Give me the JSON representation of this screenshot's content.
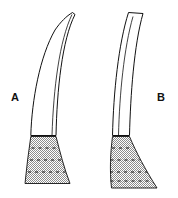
{
  "figure": {
    "background_color": "#ffffff",
    "outline_color": "#111111",
    "stipple_color": "#9a9a9a",
    "width": 178,
    "height": 198,
    "labels": [
      {
        "id": "A",
        "text": "A",
        "x": 11,
        "y": 92
      },
      {
        "id": "B",
        "text": "B",
        "x": 157,
        "y": 92
      }
    ],
    "specimens": [
      {
        "id": "A",
        "label": "A",
        "tip_style": "pointed",
        "shaft_path": "M 72.5 12.5 L 75.0 14.5 C 62.0 40.0 57.0 90.0 56.0 135.5 L 30.8 135.5 C 31.8 100.0 40.0 56.0 55.0 30.0 C 60.5 22.0 66.5 16.0 72.5 12.5 Z",
        "shaft_inner_path": "M 72.0 14.5 C 59.5 40.5 53.5 88.0 52.0 135.5",
        "base_path": "M 30.8 136.5 L 56.0 136.5 C 60.0 152.0 64.0 168.0 70.0 183.5 L 25.0 183.5 C 26.5 168.0 28.5 152.0 30.8 136.5 Z",
        "base_dashes": [
          "M 31.5 148.0 L 57.8 148.0",
          "M 30.0 160.0 L 61.0 160.0",
          "M 28.0 172.0 L 65.5 172.0"
        ],
        "base_top_y": 136,
        "base_bottom_y": 184
      },
      {
        "id": "B",
        "label": "B",
        "tip_style": "truncated",
        "shaft_path": "M 128.5 12.5 L 143.0 13.5 C 134.0 45.0 130.5 95.0 129.5 135.5 L 112.5 135.5 C 113.5 92.0 118.5 44.0 128.5 12.5 Z",
        "shaft_inner_path": "M 133.0 16.5 C 124.0 48.0 119.5 94.0 118.5 135.5",
        "base_path": "M 112.5 136.5 L 129.5 136.5 C 136.0 152.0 145.5 170.0 157.0 188.0 L 111.5 188.0 C 109.5 170.0 110.5 152.0 112.5 136.5 Z",
        "base_dashes": [
          "M 112.0 148.0 L 133.0 148.0",
          "M 110.5 160.0 L 139.5 160.0",
          "M 110.0 172.0 L 147.0 172.0",
          "M 110.5 181.0 L 152.5 181.0"
        ],
        "base_top_y": 136,
        "base_bottom_y": 188
      }
    ]
  }
}
